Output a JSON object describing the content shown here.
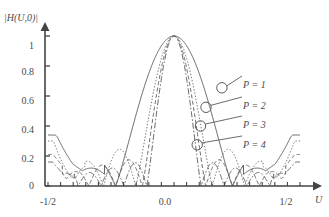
{
  "chart_data": {
    "type": "line",
    "title": "",
    "xlabel": "U",
    "ylabel": "|H(U,0)|",
    "xlim": [
      -0.5,
      0.5
    ],
    "ylim": [
      0,
      1.08
    ],
    "grid": false,
    "legend_position": "right-inline-callouts",
    "xtick_labels": [
      "-1/2",
      "0.0",
      "1/2"
    ],
    "xtick_values": [
      -0.5,
      0.0,
      0.5
    ],
    "ytick_labels": [
      "0",
      "0.2",
      "0.4",
      "0.6",
      "0.8",
      "1"
    ],
    "ytick_values": [
      0,
      0.2,
      0.4,
      0.6,
      0.8,
      1.0
    ],
    "x_minor_tick_count": 20,
    "series": [
      {
        "name": "P = 1",
        "label": "P = 1",
        "style": "solid",
        "color": "#555555",
        "main_lobe_half_width": 0.232,
        "sidelobe_peaks": [
          0.217,
          0.13,
          0.098,
          0.34
        ],
        "marker": {
          "x": 0.19,
          "y": 0.655
        }
      },
      {
        "name": "P = 2",
        "label": "P = 2",
        "style": "dotted",
        "color": "#666666",
        "main_lobe_half_width": 0.152,
        "sidelobe_peaks": [
          0.245,
          0.165,
          0.12,
          0.3
        ],
        "marker": {
          "x": 0.127,
          "y": 0.525
        }
      },
      {
        "name": "P = 3",
        "label": "P = 3",
        "style": "dashed",
        "color": "#5e5e5e",
        "main_lobe_half_width": 0.126,
        "sidelobe_peaks": [
          0.175,
          0.14,
          0.105,
          0.21
        ],
        "marker": {
          "x": 0.105,
          "y": 0.4
        }
      },
      {
        "name": "P = 4",
        "label": "P = 4",
        "style": "dashdot",
        "color": "#5a5a5a",
        "main_lobe_half_width": 0.108,
        "sidelobe_peaks": [
          0.155,
          0.12,
          0.09,
          0.16
        ],
        "marker": {
          "x": 0.092,
          "y": 0.275
        }
      }
    ],
    "annotations": [
      {
        "text": "P = 1",
        "points_to_x": 0.19,
        "points_to_y": 0.655
      },
      {
        "text": "P = 2",
        "points_to_x": 0.127,
        "points_to_y": 0.525
      },
      {
        "text": "P = 3",
        "points_to_x": 0.105,
        "points_to_y": 0.4
      },
      {
        "text": "P = 4",
        "points_to_x": 0.092,
        "points_to_y": 0.275
      }
    ]
  },
  "axes": {
    "y_axis_label": "|H(U,0)|",
    "x_axis_label": "U",
    "y_ticks": [
      "1",
      "0.8",
      "0.6",
      "0.4",
      "0.2",
      "0"
    ],
    "x_ticks": [
      "-1/2",
      "0.0",
      "1/2"
    ]
  },
  "legend": {
    "items": [
      {
        "label": "P = 1"
      },
      {
        "label": "P = 2"
      },
      {
        "label": "P = 3"
      },
      {
        "label": "P = 4"
      }
    ]
  }
}
